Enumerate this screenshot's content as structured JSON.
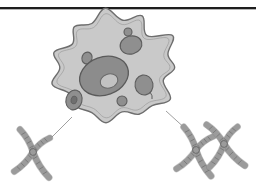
{
  "figure": {
    "caption": "",
    "background_color": "#ffffff",
    "top_rule": {
      "name": "horizontal-rule",
      "color": "#1e1e1e",
      "y": 7,
      "thickness": 2
    },
    "palette": {
      "cytoplasm_fill": "#c9c9c9",
      "cytoplasm_stroke": "#6e6e6e",
      "nucleus_fill": "#8c8c8c",
      "nucleus_stroke": "#5a5a5a",
      "nucleolus_fill": "#c2c2c2",
      "nucleolus_stroke": "#6a6a6a",
      "organelle_fill": "#8f8f8f",
      "organelle_stroke": "#5d5d5d",
      "chromosome_fill": "#9b9b9b",
      "chromosome_stroke": "#6a6a6a",
      "band_stroke": "#666666",
      "connector_stroke": "#a0a0a0"
    },
    "cell": {
      "name": "amoeboid-cell",
      "label": "Cell",
      "nucleus": {
        "name": "nucleus",
        "label": "Nucleus",
        "cx": 104,
        "cy": 76,
        "rx": 25,
        "ry": 19,
        "rotation": -20
      },
      "nucleolus": {
        "name": "nucleolus",
        "label": "Nucleolus",
        "cx": 109,
        "cy": 81,
        "rx": 9,
        "ry": 7,
        "rotation": -20
      },
      "organelles": [
        {
          "name": "organelle-small-top",
          "label": "Organelle",
          "cx": 128,
          "cy": 32,
          "rx": 4,
          "ry": 4,
          "rotation": 0
        },
        {
          "name": "organelle-upper-right",
          "label": "Organelle",
          "cx": 131,
          "cy": 45,
          "rx": 11,
          "ry": 9,
          "rotation": -15
        },
        {
          "name": "organelle-left-small",
          "label": "Organelle",
          "cx": 87,
          "cy": 58,
          "rx": 5,
          "ry": 6,
          "rotation": 20
        },
        {
          "name": "organelle-lower-left",
          "label": "Organelle",
          "cx": 74,
          "cy": 100,
          "rx": 8,
          "ry": 10,
          "rotation": 15
        },
        {
          "name": "organelle-lower-left-core",
          "label": "Organelle core",
          "cx": 74,
          "cy": 100,
          "rx": 3,
          "ry": 4,
          "rotation": 15
        },
        {
          "name": "organelle-right",
          "label": "Organelle",
          "cx": 144,
          "cy": 85,
          "rx": 9,
          "ry": 10,
          "rotation": -10
        },
        {
          "name": "organelle-bottom-center",
          "label": "Organelle",
          "cx": 122,
          "cy": 101,
          "rx": 5,
          "ry": 5,
          "rotation": 0
        }
      ]
    },
    "connectors": [
      {
        "name": "connector-left",
        "x1": 72,
        "y1": 117,
        "x2": 51,
        "y2": 138
      },
      {
        "name": "connector-right",
        "x1": 166,
        "y1": 111,
        "x2": 188,
        "y2": 131
      }
    ],
    "chromosome_groups": [
      {
        "name": "chromosome-group-left",
        "label": "Single chromosome",
        "count": 1,
        "chromosomes": [
          {
            "name": "chromosome",
            "cx": 33,
            "cy": 152,
            "scale": 1.0,
            "rotation": 8
          }
        ]
      },
      {
        "name": "chromosome-group-right",
        "label": "Chromosome pair",
        "count": 2,
        "chromosomes": [
          {
            "name": "chromosome",
            "cx": 196,
            "cy": 150,
            "scale": 1.0,
            "rotation": 10
          },
          {
            "name": "chromosome",
            "cx": 224,
            "cy": 144,
            "scale": 1.0,
            "rotation": -4
          }
        ]
      }
    ]
  }
}
